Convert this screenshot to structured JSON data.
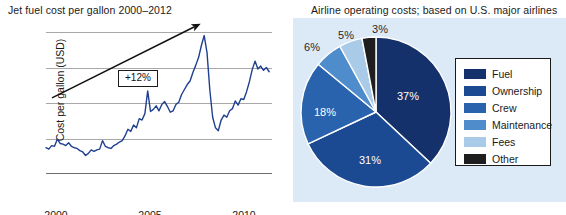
{
  "line_chart": {
    "title": "Jet fuel cost per gallon 2000–2012",
    "xlabel": "Year",
    "ylabel": "Cost per gallon (USD)",
    "yticks": [
      "$4",
      "3",
      "2",
      "1",
      "0"
    ],
    "xticks": [
      "2000",
      "2005",
      "2010"
    ],
    "annotation": "+12%"
  },
  "pie_chart": {
    "title": "Airline operating costs; based on U.S. major airlines",
    "labels": [
      "37%",
      "31%",
      "18%",
      "6%",
      "5%",
      "3%"
    ],
    "legend": [
      {
        "label": "Fuel",
        "color": "#15316b"
      },
      {
        "label": "Ownership",
        "color": "#1c4a92"
      },
      {
        "label": "Crew",
        "color": "#2a63ad"
      },
      {
        "label": "Maintenance",
        "color": "#4f8ccb"
      },
      {
        "label": "Fees",
        "color": "#a9cbe8"
      },
      {
        "label": "Other",
        "color": "#1e1e1e"
      }
    ]
  },
  "chart_data": [
    {
      "type": "line",
      "title": "Jet fuel cost per gallon 2000–2012",
      "xlabel": "Year",
      "ylabel": "Cost per gallon (USD)",
      "xlim": [
        2000,
        2012
      ],
      "ylim": [
        0,
        4
      ],
      "xticks": [
        2000,
        2005,
        2010
      ],
      "ytick_labels": [
        "0",
        "1",
        "2",
        "3",
        "$4"
      ],
      "grid": true,
      "legend": "none",
      "line_color": "#1f3f8f",
      "annotations": [
        {
          "text": "+12%",
          "type": "trend-arrow-callout",
          "arrow_from": [
            2000.3,
            2.15
          ],
          "arrow_to": [
            2008.2,
            4.15
          ]
        }
      ],
      "series": [
        {
          "name": "Jet fuel cost per gallon (USD)",
          "x": [
            2000.0,
            2000.15,
            2000.3,
            2000.45,
            2000.6,
            2000.75,
            2000.9,
            2001.05,
            2001.2,
            2001.35,
            2001.5,
            2001.65,
            2001.8,
            2001.95,
            2002.1,
            2002.25,
            2002.4,
            2002.55,
            2002.7,
            2002.85,
            2003.0,
            2003.15,
            2003.3,
            2003.45,
            2003.6,
            2003.75,
            2003.9,
            2004.05,
            2004.2,
            2004.35,
            2004.5,
            2004.65,
            2004.8,
            2004.95,
            2005.1,
            2005.25,
            2005.4,
            2005.55,
            2005.7,
            2005.85,
            2006.0,
            2006.15,
            2006.3,
            2006.45,
            2006.6,
            2006.75,
            2006.9,
            2007.05,
            2007.2,
            2007.35,
            2007.5,
            2007.65,
            2007.8,
            2007.95,
            2008.1,
            2008.25,
            2008.4,
            2008.55,
            2008.7,
            2008.85,
            2009.0,
            2009.15,
            2009.3,
            2009.45,
            2009.6,
            2009.75,
            2009.9,
            2010.05,
            2010.2,
            2010.35,
            2010.5,
            2010.65,
            2010.8,
            2010.95,
            2011.1,
            2011.25,
            2011.4,
            2011.55,
            2011.7,
            2011.85
          ],
          "y": [
            0.74,
            0.7,
            0.8,
            0.78,
            0.98,
            0.86,
            0.84,
            0.8,
            0.88,
            0.78,
            0.74,
            0.72,
            0.66,
            0.62,
            0.52,
            0.58,
            0.68,
            0.64,
            0.68,
            0.7,
            0.94,
            0.78,
            0.74,
            0.72,
            0.8,
            0.84,
            0.9,
            0.94,
            1.08,
            1.26,
            1.2,
            1.38,
            1.3,
            1.56,
            1.52,
            1.7,
            2.34,
            1.76,
            1.82,
            1.92,
            1.78,
            1.96,
            2.04,
            1.9,
            1.74,
            1.78,
            1.96,
            2.02,
            2.24,
            2.38,
            2.52,
            2.62,
            2.86,
            3.06,
            3.28,
            3.62,
            3.9,
            3.42,
            2.36,
            1.6,
            1.3,
            1.22,
            1.52,
            1.66,
            1.6,
            1.78,
            1.84,
            2.06,
            1.94,
            2.12,
            2.1,
            2.32,
            2.6,
            2.94,
            3.18,
            2.96,
            3.04,
            2.92,
            3.0,
            2.88
          ]
        }
      ]
    },
    {
      "type": "pie",
      "title": "Airline operating costs; based on U.S. major airlines",
      "categories": [
        "Fuel",
        "Ownership",
        "Crew",
        "Maintenance",
        "Fees",
        "Other"
      ],
      "values": [
        37,
        31,
        18,
        6,
        5,
        3
      ],
      "value_labels": [
        "37%",
        "31%",
        "18%",
        "6%",
        "5%",
        "3%"
      ],
      "colors": [
        "#15316b",
        "#1c4a92",
        "#2a63ad",
        "#4f8ccb",
        "#a9cbe8",
        "#1e1e1e"
      ],
      "legend": "right",
      "start_angle_deg": 0,
      "direction": "clockwise"
    }
  ]
}
